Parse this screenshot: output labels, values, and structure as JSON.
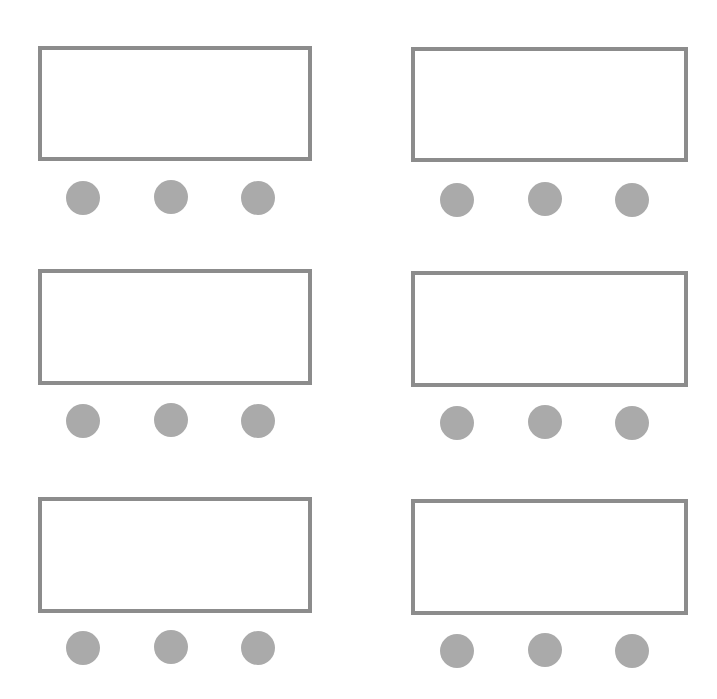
{
  "diagram": {
    "colors": {
      "background": "#ffffff",
      "box_border": "#8c8c8c",
      "box_fill": "#ffffff",
      "dot_fill": "#aaaaaa"
    },
    "units": [
      {
        "id": "unit-1",
        "row": 1,
        "column": 1,
        "dots": 3
      },
      {
        "id": "unit-2",
        "row": 1,
        "column": 2,
        "dots": 3
      },
      {
        "id": "unit-3",
        "row": 2,
        "column": 1,
        "dots": 3
      },
      {
        "id": "unit-4",
        "row": 2,
        "column": 2,
        "dots": 3
      },
      {
        "id": "unit-5",
        "row": 3,
        "column": 1,
        "dots": 3
      },
      {
        "id": "unit-6",
        "row": 3,
        "column": 2,
        "dots": 3
      }
    ]
  }
}
